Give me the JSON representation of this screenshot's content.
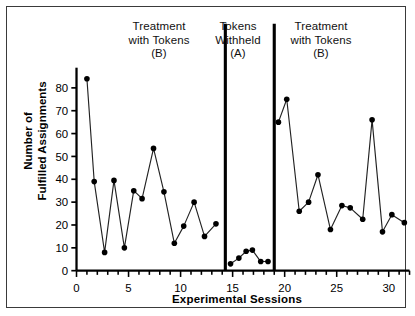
{
  "figure": {
    "border_color": "#3a3a3a",
    "background": "#ffffff"
  },
  "chart_data": {
    "type": "line",
    "title": "",
    "xlabel": "Experimental Sessions",
    "ylabel": "Number of\nFulfilled Assignments",
    "xlim": [
      0,
      32
    ],
    "ylim": [
      0,
      87
    ],
    "xticks": [
      0,
      5,
      10,
      15,
      20,
      25,
      30
    ],
    "xtick_labels": [
      "0",
      "5",
      "10",
      "15",
      "20",
      "25",
      "30"
    ],
    "yticks": [
      0,
      10,
      20,
      30,
      40,
      50,
      60,
      70,
      80
    ],
    "ytick_labels": [
      "0",
      "10",
      "20",
      "30",
      "40",
      "50",
      "60",
      "70",
      "80"
    ],
    "xtick_minor_step": 1,
    "grid": false,
    "legend": "none",
    "marker": "filled-circle",
    "marker_color": "#000000",
    "line_color": "#222222",
    "phase_lines": [
      14.3,
      19.0
    ],
    "phases": [
      {
        "name": "Treatment with Tokens (B)",
        "label": "Treatment\nwith Tokens\n(B)",
        "condition": "B",
        "x": [
          1,
          1.7,
          2.7,
          3.6,
          4.6,
          5.5,
          6.3,
          7.4,
          8.4,
          9.4,
          10.3,
          11.3,
          12.3,
          13.4
        ],
        "y": [
          84,
          39,
          8,
          39.5,
          10,
          35,
          31.5,
          53.5,
          34.5,
          12,
          19.5,
          30,
          15,
          20.5
        ]
      },
      {
        "name": "Tokens Withheld (A)",
        "label": "Tokens\nWithheld\n(A)",
        "condition": "A",
        "x": [
          14.8,
          15.6,
          16.3,
          16.9,
          17.7,
          18.4
        ],
        "y": [
          3,
          5.5,
          8.5,
          9,
          4,
          4
        ]
      },
      {
        "name": "Treatment with Tokens (B)",
        "label": "Treatment\nwith Tokens\n(B)",
        "condition": "B",
        "x": [
          19.4,
          20.2,
          21.4,
          22.3,
          23.2,
          24.4,
          25.5,
          26.3,
          27.5,
          28.4,
          29.4,
          30.3,
          31.5
        ],
        "y": [
          65,
          75,
          26,
          30,
          42,
          18,
          28.5,
          27.5,
          22.5,
          66,
          17,
          24.5,
          21
        ]
      }
    ]
  }
}
